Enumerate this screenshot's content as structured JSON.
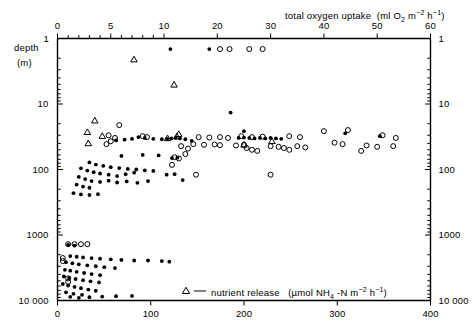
{
  "chart_data": {
    "type": "scatter",
    "title": "",
    "xlabel_top": "total oxygen uptake  (ml O₂ m⁻² h⁻¹)",
    "xlabel_bottom_legend": "nutrient release   (µmol NH₄ -N m⁻² h⁻¹)",
    "ylabel": "depth",
    "ylabel_units": "(m)",
    "yscale": "log",
    "ylim": [
      1,
      10000
    ],
    "ytick_labels": [
      "1",
      "10",
      "100",
      "1000",
      "10 000"
    ],
    "ytick_labels_right": [
      "1",
      "10",
      "100",
      "1000",
      "10 000"
    ],
    "xscale_top": "piecewise",
    "xlim_top": [
      0,
      60
    ],
    "xtick_labels_top": [
      "0",
      "5",
      "10",
      "20",
      "30",
      "40",
      "50",
      "60"
    ],
    "xlim_bottom": [
      0,
      400
    ],
    "xtick_labels_bottom": [
      "0",
      "100",
      "200",
      "300",
      "400"
    ],
    "grid": false,
    "legend_position": "bottom-center",
    "series": [
      {
        "name": "total oxygen uptake (filled circles)",
        "marker": "filled-circle",
        "axis": "top",
        "points": [
          [
            11.2,
            1.45
          ],
          [
            18.5,
            1.45
          ],
          [
            22.5,
            13.5
          ],
          [
            25.0,
            26.0
          ],
          [
            7.6,
            32.0
          ],
          [
            8.2,
            33.0
          ],
          [
            9.0,
            34.0
          ],
          [
            9.8,
            34.5
          ],
          [
            10.6,
            34.0
          ],
          [
            11.4,
            33.5
          ],
          [
            12.2,
            33.0
          ],
          [
            13.0,
            33.5
          ],
          [
            14.0,
            34.5
          ],
          [
            15.2,
            36.5
          ],
          [
            5.5,
            36.0
          ],
          [
            6.3,
            35.0
          ],
          [
            7.0,
            34.0
          ],
          [
            24.0,
            33.0
          ],
          [
            25.0,
            32.5
          ],
          [
            26.0,
            33.0
          ],
          [
            27.0,
            33.5
          ],
          [
            28.0,
            33.0
          ],
          [
            29.0,
            33.5
          ],
          [
            30.0,
            33.0
          ],
          [
            31.0,
            33.5
          ],
          [
            32.0,
            34.0
          ],
          [
            44.0,
            28.0
          ],
          [
            50.5,
            31.0
          ],
          [
            6.0,
            62.0
          ],
          [
            8.0,
            60.0
          ],
          [
            9.5,
            61.0
          ],
          [
            11.5,
            67.0
          ],
          [
            12.5,
            66.0
          ],
          [
            3.0,
            78.0
          ],
          [
            3.6,
            84.0
          ],
          [
            4.3,
            88.0
          ],
          [
            5.0,
            92.0
          ],
          [
            5.8,
            95.0
          ],
          [
            6.6,
            98.0
          ],
          [
            7.4,
            100.0
          ],
          [
            8.2,
            103.0
          ],
          [
            9.0,
            105.0
          ],
          [
            2.2,
            96.0
          ],
          [
            2.8,
            104.0
          ],
          [
            3.4,
            110.0
          ],
          [
            4.0,
            115.0
          ],
          [
            4.8,
            120.0
          ],
          [
            5.6,
            126.0
          ],
          [
            6.4,
            118.0
          ],
          [
            7.2,
            112.0
          ],
          [
            2.0,
            130.0
          ],
          [
            2.6,
            140.0
          ],
          [
            3.2,
            150.0
          ],
          [
            4.0,
            155.0
          ],
          [
            4.8,
            148.0
          ],
          [
            5.6,
            158.0
          ],
          [
            6.5,
            152.0
          ],
          [
            7.5,
            160.0
          ],
          [
            8.5,
            150.0
          ],
          [
            1.8,
            170.0
          ],
          [
            2.4,
            182.0
          ],
          [
            3.0,
            190.0
          ],
          [
            10.5,
            120.0
          ],
          [
            12.0,
            118.0
          ],
          [
            13.5,
            145.0
          ],
          [
            1.5,
            230.0
          ],
          [
            2.2,
            240.0
          ],
          [
            3.0,
            245.0
          ],
          [
            3.8,
            238.0
          ],
          [
            1.0,
            1420.0
          ],
          [
            1.6,
            1450.0
          ],
          [
            1.2,
            2100.0
          ],
          [
            1.8,
            2150.0
          ],
          [
            2.4,
            2200.0
          ],
          [
            3.2,
            2250.0
          ],
          [
            4.0,
            2300.0
          ],
          [
            5.0,
            2350.0
          ],
          [
            6.0,
            2400.0
          ],
          [
            7.2,
            2450.0
          ],
          [
            0.8,
            2600.0
          ],
          [
            1.4,
            2700.0
          ],
          [
            2.0,
            2800.0
          ],
          [
            2.8,
            2900.0
          ],
          [
            3.6,
            3000.0
          ],
          [
            4.4,
            3100.0
          ],
          [
            5.4,
            3200.0
          ],
          [
            0.7,
            3400.0
          ],
          [
            1.2,
            3500.0
          ],
          [
            1.8,
            3650.0
          ],
          [
            2.5,
            3800.0
          ],
          [
            3.2,
            3950.0
          ],
          [
            4.0,
            4100.0
          ],
          [
            0.6,
            4300.0
          ],
          [
            1.1,
            4500.0
          ],
          [
            1.7,
            4700.0
          ],
          [
            2.4,
            4900.0
          ],
          [
            3.1,
            5100.0
          ],
          [
            3.9,
            5300.0
          ],
          [
            0.5,
            5600.0
          ],
          [
            1.0,
            5900.0
          ],
          [
            1.6,
            6200.0
          ],
          [
            2.2,
            6500.0
          ],
          [
            2.9,
            6800.0
          ],
          [
            3.6,
            7100.0
          ],
          [
            0.8,
            7500.0
          ],
          [
            1.5,
            7900.0
          ],
          [
            2.3,
            8200.0
          ],
          [
            1.2,
            8800.0
          ],
          [
            2.0,
            9100.0
          ],
          [
            3.0,
            8900.0
          ],
          [
            4.2,
            8700.0
          ],
          [
            5.5,
            8600.0
          ],
          [
            7.0,
            8500.0
          ],
          [
            8.5,
            2450.0
          ],
          [
            9.8,
            2500.0
          ],
          [
            11.0,
            2550.0
          ]
        ]
      },
      {
        "name": "total oxygen uptake (open circles)",
        "marker": "open-circle",
        "axis": "top",
        "points": [
          [
            20.5,
            1.45
          ],
          [
            22.3,
            1.45
          ],
          [
            26.0,
            1.45
          ],
          [
            28.5,
            1.45
          ],
          [
            5.8,
            21.0
          ],
          [
            4.8,
            30.0
          ],
          [
            5.4,
            33.0
          ],
          [
            5.0,
            37.0
          ],
          [
            4.6,
            41.0
          ],
          [
            8.0,
            31.0
          ],
          [
            8.4,
            32.0
          ],
          [
            16.5,
            32.0
          ],
          [
            18.5,
            32.5
          ],
          [
            20.5,
            32.0
          ],
          [
            22.0,
            33.0
          ],
          [
            24.5,
            31.0
          ],
          [
            26.5,
            32.0
          ],
          [
            28.5,
            31.5
          ],
          [
            33.5,
            31.0
          ],
          [
            35.5,
            32.0
          ],
          [
            40.0,
            26.0
          ],
          [
            44.5,
            25.0
          ],
          [
            51.0,
            30.0
          ],
          [
            53.5,
            33.0
          ],
          [
            15.5,
            41.0
          ],
          [
            17.5,
            42.0
          ],
          [
            19.5,
            41.5
          ],
          [
            20.5,
            42.5
          ],
          [
            23.5,
            43.0
          ],
          [
            25.0,
            42.0
          ],
          [
            30.0,
            44.0
          ],
          [
            31.5,
            45.0
          ],
          [
            32.5,
            47.0
          ],
          [
            33.5,
            50.0
          ],
          [
            35.0,
            44.0
          ],
          [
            36.5,
            46.0
          ],
          [
            42.0,
            39.0
          ],
          [
            43.5,
            41.0
          ],
          [
            48.0,
            43.0
          ],
          [
            50.0,
            45.0
          ],
          [
            53.0,
            44.0
          ],
          [
            13.2,
            44.0
          ],
          [
            14.5,
            48.0
          ],
          [
            14.0,
            58.0
          ],
          [
            25.5,
            47.0
          ],
          [
            26.5,
            50.0
          ],
          [
            27.5,
            52.0
          ],
          [
            11.5,
            85.0
          ],
          [
            16.0,
            120.0
          ],
          [
            30.0,
            120.0
          ],
          [
            47.0,
            52.0
          ],
          [
            12.0,
            65.0
          ],
          [
            12.8,
            68.0
          ],
          [
            1.0,
            1380.0
          ],
          [
            1.6,
            1380.0
          ],
          [
            2.2,
            1380.0
          ],
          [
            2.8,
            1380.0
          ],
          [
            0.5,
            2250.0
          ],
          [
            0.5,
            2500.0
          ],
          [
            1.0,
            4600.0
          ],
          [
            1.0,
            5200.0
          ]
        ]
      },
      {
        "name": "nutrient release (triangles)",
        "marker": "open-triangle",
        "axis": "bottom",
        "points": [
          [
            82,
            2.1
          ],
          [
            125,
            5.1
          ],
          [
            40,
            18.0
          ],
          [
            32,
            27.0
          ],
          [
            130,
            29.0
          ],
          [
            48,
            31.0
          ],
          [
            33,
            40.0
          ],
          [
            200,
            42.0
          ],
          [
            230,
            37.0
          ],
          [
            128,
            31.5
          ],
          [
            118,
            33.5
          ]
        ]
      }
    ]
  },
  "axes": {
    "top": {
      "title": "total oxygen uptake",
      "units_prefix": "(ml O",
      "units_sub": "2",
      "units_mid": " m",
      "units_sup1": "−2",
      "units_mid2": " h",
      "units_sup2": "−1",
      "units_suffix": ")",
      "ticks": [
        {
          "label": "0",
          "v": 0
        },
        {
          "label": "5",
          "v": 5
        },
        {
          "label": "10",
          "v": 10
        },
        {
          "label": "20",
          "v": 20
        },
        {
          "label": "30",
          "v": 30
        },
        {
          "label": "40",
          "v": 40
        },
        {
          "label": "50",
          "v": 50
        },
        {
          "label": "60",
          "v": 60
        }
      ]
    },
    "bottom": {
      "ticks": [
        {
          "label": "0",
          "v": 0
        },
        {
          "label": "100",
          "v": 100
        },
        {
          "label": "200",
          "v": 200
        },
        {
          "label": "300",
          "v": 300
        },
        {
          "label": "400",
          "v": 400
        }
      ]
    },
    "left": {
      "title": "depth",
      "units": "(m)",
      "ticks": [
        {
          "label": "1",
          "v": 1
        },
        {
          "label": "10",
          "v": 10
        },
        {
          "label": "100",
          "v": 100
        },
        {
          "label": "1000",
          "v": 1000
        },
        {
          "label": "10 000",
          "v": 10000
        }
      ]
    },
    "right": {
      "ticks": [
        {
          "label": "1",
          "v": 1
        },
        {
          "label": "10",
          "v": 10
        },
        {
          "label": "100",
          "v": 100
        },
        {
          "label": "1000",
          "v": 1000
        },
        {
          "label": "10 000",
          "v": 10000
        }
      ]
    }
  },
  "legend": {
    "marker": "open-triangle",
    "dash": "—",
    "label": "nutrient release",
    "units_prefix": "(µmol NH",
    "units_sub": "4",
    "units_mid": " -N m",
    "units_sup1": "−2",
    "units_mid2": " h",
    "units_sup2": "−1",
    "units_suffix": ")"
  },
  "colors": {
    "axis": "#000000",
    "marker": "#000000",
    "background": "#ffffff"
  }
}
